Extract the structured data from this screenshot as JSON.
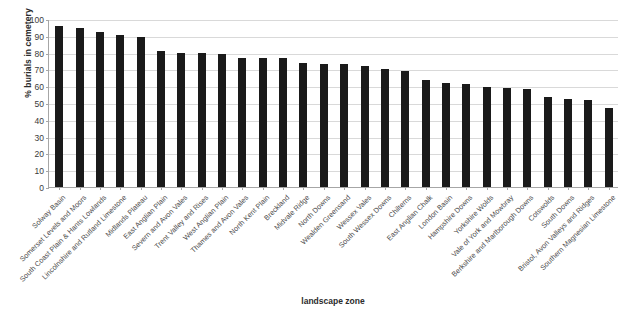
{
  "chart_data": {
    "type": "bar",
    "title": "",
    "xlabel": "landscape zone",
    "ylabel": "% burials in cemetery",
    "ylim": [
      0,
      100
    ],
    "yticks": [
      0,
      10,
      20,
      30,
      40,
      50,
      60,
      70,
      80,
      90,
      100
    ],
    "grid": true,
    "legend": "none",
    "bar_color": "#1a1a1a",
    "categories": [
      "Solway Basin",
      "Somerset Levels and Moors",
      "South Coast Plain & Hants Lowlands",
      "Lincolnshire and Rutland Limestone",
      "Midlands Plateau",
      "East Anglian Plain",
      "Severn and Avon Vales",
      "Trent Valley and Rises",
      "West Anglian Plain",
      "Thames and Avon Vales",
      "North Kent Plain",
      "Breckland",
      "Midvale Ridge",
      "North Downs",
      "Wealden Greensand",
      "Wessex Vales",
      "South Wessex Downs",
      "Chilterns",
      "East Anglian Chalk",
      "London Basin",
      "Hampshire Downs",
      "Yorkshire Wolds",
      "Vale of York and Mowbray",
      "Berkshire and Marlborough Downs",
      "Cotswolds",
      "South Downs",
      "Bristol, Avon Valleys and Ridges",
      "Southern Magnesian Limestone"
    ],
    "values": [
      96,
      94.5,
      92.5,
      90.5,
      89,
      81,
      79.5,
      79.5,
      79,
      77,
      76.5,
      76.5,
      74,
      73.5,
      73,
      72,
      70.5,
      69,
      63.5,
      62,
      61.5,
      59.5,
      59,
      58.5,
      53.5,
      52.5,
      52,
      47
    ]
  }
}
